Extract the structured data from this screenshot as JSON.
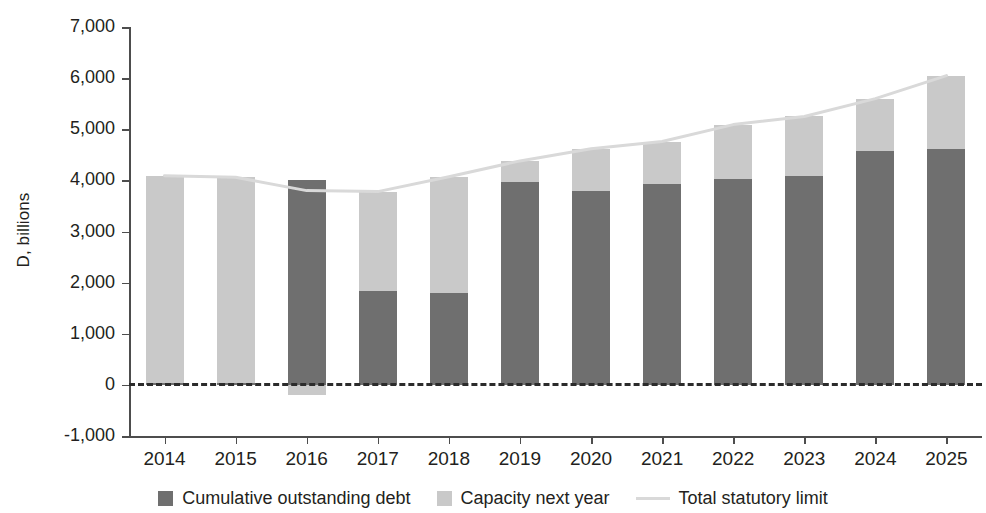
{
  "chart_data": {
    "type": "bar",
    "subtype": "stacked-bar-with-line-overlay",
    "title": "",
    "xlabel": "",
    "ylabel": "D, billions",
    "categories": [
      "2014",
      "2015",
      "2016",
      "2017",
      "2018",
      "2019",
      "2020",
      "2021",
      "2022",
      "2023",
      "2024",
      "2025"
    ],
    "ylim": [
      -1000,
      7000
    ],
    "ytick_labels": [
      "7,000",
      "6,000",
      "5,000",
      "4,000",
      "3,000",
      "2,000",
      "1,000",
      "0",
      "-1,000"
    ],
    "ytick_values": [
      7000,
      6000,
      5000,
      4000,
      3000,
      2000,
      1000,
      0,
      -1000
    ],
    "grid": false,
    "zero_line": "dashed",
    "legend_position": "bottom",
    "series": [
      {
        "name": "Cumulative outstanding debt",
        "type": "bar",
        "color": "#6f6f6f",
        "values": [
          40,
          40,
          4000,
          1840,
          1800,
          3970,
          3800,
          3930,
          4030,
          4090,
          4580,
          4620
        ]
      },
      {
        "name": "Capacity next year",
        "type": "bar",
        "color": "#c9c9c9",
        "values": [
          4050,
          4020,
          -200,
          1940,
          2270,
          410,
          820,
          830,
          1060,
          1160,
          1020,
          1430
        ]
      },
      {
        "name": "Total statutory limit",
        "type": "line",
        "color": "#d9d9d9",
        "values": [
          4090,
          4060,
          3800,
          3780,
          4070,
          4380,
          4620,
          4760,
          5090,
          5250,
          5600,
          6050
        ]
      }
    ]
  },
  "legend": {
    "items": [
      {
        "label": "Cumulative outstanding debt",
        "marker": "square",
        "color": "#6f6f6f"
      },
      {
        "label": "Capacity next year",
        "marker": "square",
        "color": "#c9c9c9"
      },
      {
        "label": "Total statutory limit",
        "marker": "line",
        "color": "#d9d9d9"
      }
    ]
  }
}
